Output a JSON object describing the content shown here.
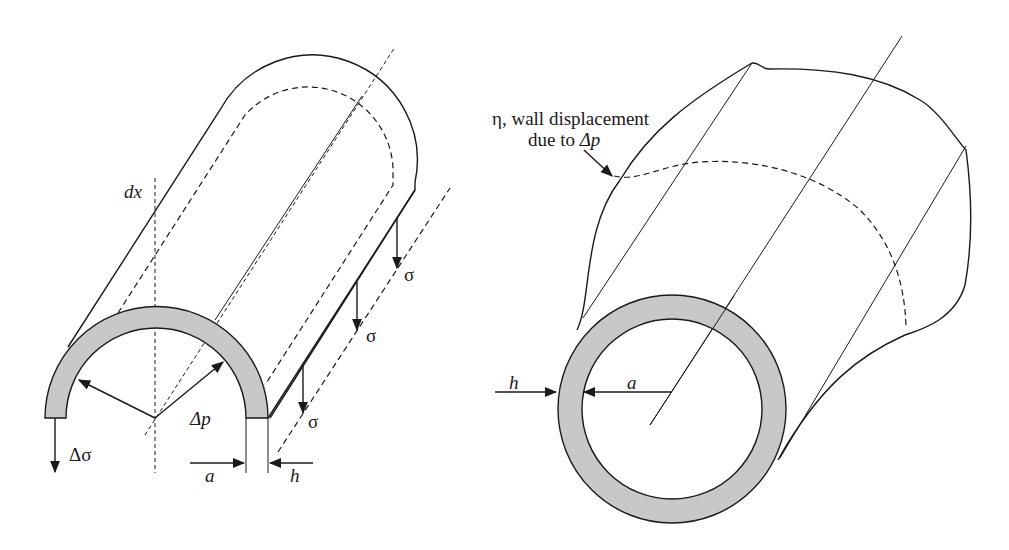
{
  "figure": {
    "left_panel": {
      "title": "Half-tube element of length dx under pressure increment",
      "labels": {
        "dx": "dx",
        "delta_p": "Δp",
        "delta_sigma": "Δσ",
        "sigma_1": "σ",
        "sigma_2": "σ",
        "sigma_3": "σ",
        "a": "a",
        "h": "h"
      }
    },
    "right_panel": {
      "title": "Bulging tube wall",
      "labels": {
        "annotation_line1": "η, wall displacement",
        "annotation_line2_prefix": "due to ",
        "annotation_line2_var": "Δp",
        "h": "h",
        "a": "a"
      }
    },
    "colors": {
      "stroke": "#1a1a1a",
      "wall_fill": "#c8c8c8",
      "background": "#ffffff"
    }
  }
}
